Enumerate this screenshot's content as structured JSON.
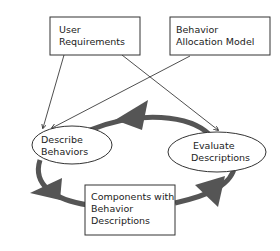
{
  "diagram": {
    "nodes": {
      "user_requirements": {
        "line1": "User",
        "line2": "Requirements"
      },
      "behavior_allocation_model": {
        "line1": "Behavior",
        "line2": "Allocation Model"
      },
      "describe_behaviors": {
        "line1": "Describe",
        "line2": "Behaviors"
      },
      "evaluate_descriptions": {
        "line1": "Evaluate",
        "line2": "Descriptions"
      },
      "components": {
        "line1": "Components with",
        "line2": "Behavior",
        "line3": "Descriptions"
      }
    },
    "colors": {
      "cycle_arrow": "#555555",
      "lines": "#222222"
    }
  }
}
